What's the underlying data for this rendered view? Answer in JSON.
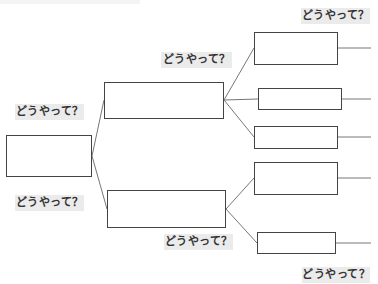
{
  "diagram": {
    "type": "logic-tree",
    "question_label": "どうやって？",
    "labels": [
      {
        "id": "label-top-right",
        "text": "どうやって？",
        "x": 301,
        "y": 8,
        "w": 69
      },
      {
        "id": "label-mid-top",
        "text": "どうやって？",
        "x": 161,
        "y": 52,
        "w": 71
      },
      {
        "id": "label-left-upper",
        "text": "どうやって？",
        "x": 15,
        "y": 104,
        "w": 69
      },
      {
        "id": "label-left-lower",
        "text": "どうやって？",
        "x": 15,
        "y": 195,
        "w": 69
      },
      {
        "id": "label-mid-bottom",
        "text": "どうやって？",
        "x": 164,
        "y": 234,
        "w": 69
      },
      {
        "id": "label-bottom-right",
        "text": "どうやって？",
        "x": 302,
        "y": 267,
        "w": 68
      }
    ],
    "boxes": [
      {
        "id": "root",
        "level": 0,
        "x": 6,
        "y": 135,
        "w": 86,
        "h": 42,
        "text": ""
      },
      {
        "id": "mid-top",
        "level": 1,
        "x": 104,
        "y": 82,
        "w": 120,
        "h": 37,
        "text": ""
      },
      {
        "id": "mid-bottom",
        "level": 1,
        "x": 107,
        "y": 190,
        "w": 119,
        "h": 38,
        "text": ""
      },
      {
        "id": "leaf-1",
        "level": 2,
        "x": 254,
        "y": 32,
        "w": 84,
        "h": 33,
        "text": ""
      },
      {
        "id": "leaf-2",
        "level": 2,
        "x": 258,
        "y": 88,
        "w": 84,
        "h": 22,
        "text": ""
      },
      {
        "id": "leaf-3",
        "level": 2,
        "x": 254,
        "y": 126,
        "w": 84,
        "h": 23,
        "text": ""
      },
      {
        "id": "leaf-4",
        "level": 2,
        "x": 254,
        "y": 162,
        "w": 84,
        "h": 33,
        "text": ""
      },
      {
        "id": "leaf-5",
        "level": 2,
        "x": 257,
        "y": 232,
        "w": 79,
        "h": 22,
        "text": ""
      }
    ],
    "connectors": [
      {
        "from": "root",
        "to": "mid-top",
        "x1": 92,
        "y1": 156,
        "x2": 104,
        "y2": 100
      },
      {
        "from": "root",
        "to": "mid-bottom",
        "x1": 92,
        "y1": 156,
        "x2": 107,
        "y2": 209
      },
      {
        "from": "mid-top",
        "to": "leaf-1",
        "x1": 224,
        "y1": 100,
        "x2": 254,
        "y2": 48
      },
      {
        "from": "mid-top",
        "to": "leaf-2",
        "x1": 224,
        "y1": 100,
        "x2": 258,
        "y2": 99
      },
      {
        "from": "mid-top",
        "to": "leaf-3",
        "x1": 224,
        "y1": 100,
        "x2": 254,
        "y2": 137
      },
      {
        "from": "mid-bottom",
        "to": "leaf-4",
        "x1": 226,
        "y1": 209,
        "x2": 254,
        "y2": 178
      },
      {
        "from": "mid-bottom",
        "to": "leaf-5",
        "x1": 226,
        "y1": 209,
        "x2": 257,
        "y2": 243
      },
      {
        "from": "leaf-1",
        "to": "edge",
        "x1": 338,
        "y1": 48,
        "x2": 371,
        "y2": 48
      },
      {
        "from": "leaf-2",
        "to": "edge",
        "x1": 342,
        "y1": 99,
        "x2": 371,
        "y2": 99
      },
      {
        "from": "leaf-3",
        "to": "edge",
        "x1": 338,
        "y1": 137,
        "x2": 371,
        "y2": 137
      },
      {
        "from": "leaf-4",
        "to": "edge",
        "x1": 338,
        "y1": 178,
        "x2": 371,
        "y2": 178
      },
      {
        "from": "leaf-5",
        "to": "edge",
        "x1": 336,
        "y1": 243,
        "x2": 371,
        "y2": 243
      }
    ],
    "colors": {
      "box_border": "#444444",
      "line": "#777777",
      "label_bg": "#ebebeb",
      "label_text": "#333333"
    }
  }
}
